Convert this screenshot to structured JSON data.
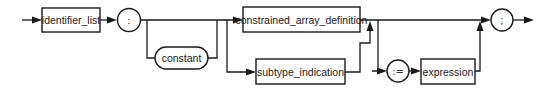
{
  "diagram": {
    "type": "syntax_diagram",
    "nodes": {
      "identifier_list": {
        "label": "identifier_list",
        "kind": "nonterminal"
      },
      "colon": {
        "label": ":",
        "kind": "terminal"
      },
      "constant": {
        "label": "constant",
        "kind": "reserved_word"
      },
      "constrained_array_definition": {
        "label": "constrained_array_definition",
        "kind": "nonterminal"
      },
      "subtype_indication": {
        "label": "subtype_indication",
        "kind": "nonterminal"
      },
      "assign": {
        "label": ":=",
        "kind": "terminal"
      },
      "expression": {
        "label": "expression",
        "kind": "nonterminal"
      },
      "semicolon": {
        "label": ";",
        "kind": "terminal"
      }
    },
    "edges": [
      [
        "start",
        "identifier_list"
      ],
      [
        "identifier_list",
        "colon"
      ],
      [
        "colon",
        "constant"
      ],
      [
        "colon",
        "constrained_array_definition"
      ],
      [
        "constant",
        "constrained_array_definition"
      ],
      [
        "colon",
        "subtype_indication"
      ],
      [
        "constant",
        "subtype_indication"
      ],
      [
        "constrained_array_definition",
        "semicolon"
      ],
      [
        "subtype_indication",
        "semicolon"
      ],
      [
        "constrained_array_definition",
        "assign"
      ],
      [
        "subtype_indication",
        "assign"
      ],
      [
        "assign",
        "expression"
      ],
      [
        "expression",
        "semicolon"
      ],
      [
        "semicolon",
        "end"
      ]
    ],
    "colors": {
      "stroke": "#1a1a1a",
      "background": "#ffffff"
    }
  }
}
